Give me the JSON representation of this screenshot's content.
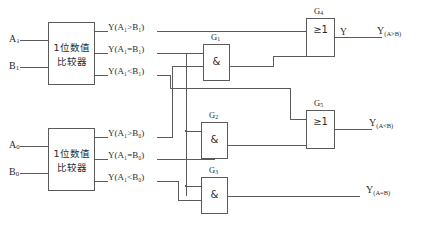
{
  "diagram": {
    "type": "logic-circuit",
    "width": 422,
    "height": 226,
    "colors": {
      "stroke": "#5a5a5a",
      "text": "#2b2b2b",
      "background": "#ffffff"
    }
  },
  "comparators": [
    {
      "id": "comparator-high",
      "label_line1": "1位数值",
      "label_line2": "比较器",
      "inputs": [
        {
          "name": "input-a1",
          "label": "A",
          "sub": "1"
        },
        {
          "name": "input-b1",
          "label": "B",
          "sub": "1"
        }
      ],
      "outputs": [
        {
          "name": "out-a1-gt-b1",
          "text": "Y(A₁>B₁)"
        },
        {
          "name": "out-a1-eq-b1",
          "text": "Y(A₁=B₁)"
        },
        {
          "name": "out-a1-lt-b1",
          "text": "Y(A₁<B₁)"
        }
      ]
    },
    {
      "id": "comparator-low",
      "label_line1": "1位数值",
      "label_line2": "比较器",
      "inputs": [
        {
          "name": "input-a0",
          "label": "A",
          "sub": "0"
        },
        {
          "name": "input-b0",
          "label": "B",
          "sub": "0"
        }
      ],
      "outputs": [
        {
          "name": "out-a0-gt-b0",
          "text": "Y(A₁>B₀)"
        },
        {
          "name": "out-a0-eq-b0",
          "text": "Y(A₁=B₀)"
        },
        {
          "name": "out-a0-lt-b0",
          "text": "Y(A₁<B₀)"
        }
      ]
    }
  ],
  "gates": [
    {
      "name": "gate-g1",
      "label": "G",
      "sub": "1",
      "symbol": "&",
      "kind": "AND"
    },
    {
      "name": "gate-g2",
      "label": "G",
      "sub": "2",
      "symbol": "&",
      "kind": "AND"
    },
    {
      "name": "gate-g3",
      "label": "G",
      "sub": "3",
      "symbol": "&",
      "kind": "AND"
    },
    {
      "name": "gate-g4",
      "label": "G",
      "sub": "4",
      "symbol": "≥1",
      "kind": "OR"
    },
    {
      "name": "gate-g5",
      "label": "G",
      "sub": "5",
      "symbol": "≥1",
      "kind": "OR"
    }
  ],
  "outputs": [
    {
      "name": "output-a-gt-b",
      "main": "Y",
      "sub": "(A>B)"
    },
    {
      "name": "output-a-lt-b",
      "main": "Y",
      "sub": "(A<B)"
    },
    {
      "name": "output-a-eq-b",
      "main": "Y",
      "sub": "(A=B)"
    }
  ],
  "node_labels": {
    "g4_out": "Y"
  }
}
